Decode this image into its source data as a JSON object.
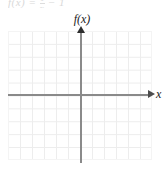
{
  "figure": {
    "width": 167,
    "height": 173,
    "background_color": "#ffffff",
    "clipped_header_text": "f(x) =",
    "clipped_header_fragment_left": "f(x) =",
    "clipped_header_fragment_mid_num": "1",
    "clipped_header_fragment_mid_den": "x",
    "clipped_header_fragment_right": "− 1"
  },
  "axes": {
    "y_axis_label": "f(x)",
    "x_axis_label": "x",
    "axis_color": "#8a8a8a",
    "arrow_color": "#2e2e2e",
    "y_axis_name": "y-axis",
    "x_axis_name": "x-axis"
  },
  "grid": {
    "color": "#ededed",
    "cell_width_px": 12,
    "cell_height_px": 12.9,
    "columns": 12,
    "rows": 10,
    "show_grid": true,
    "tick_labels": []
  },
  "chart_data": {
    "type": "line",
    "title": "",
    "subtitle": "",
    "xlabel": "x",
    "ylabel": "f(x)",
    "xlim": [
      -6,
      6
    ],
    "ylim": [
      -5,
      5
    ],
    "grid": true,
    "legend": "none",
    "categories": [],
    "x": [],
    "series": [],
    "values": [],
    "annotations": [],
    "note": "Empty coordinate plane: light gray grid with labeled axes and no plotted curve or data points."
  }
}
